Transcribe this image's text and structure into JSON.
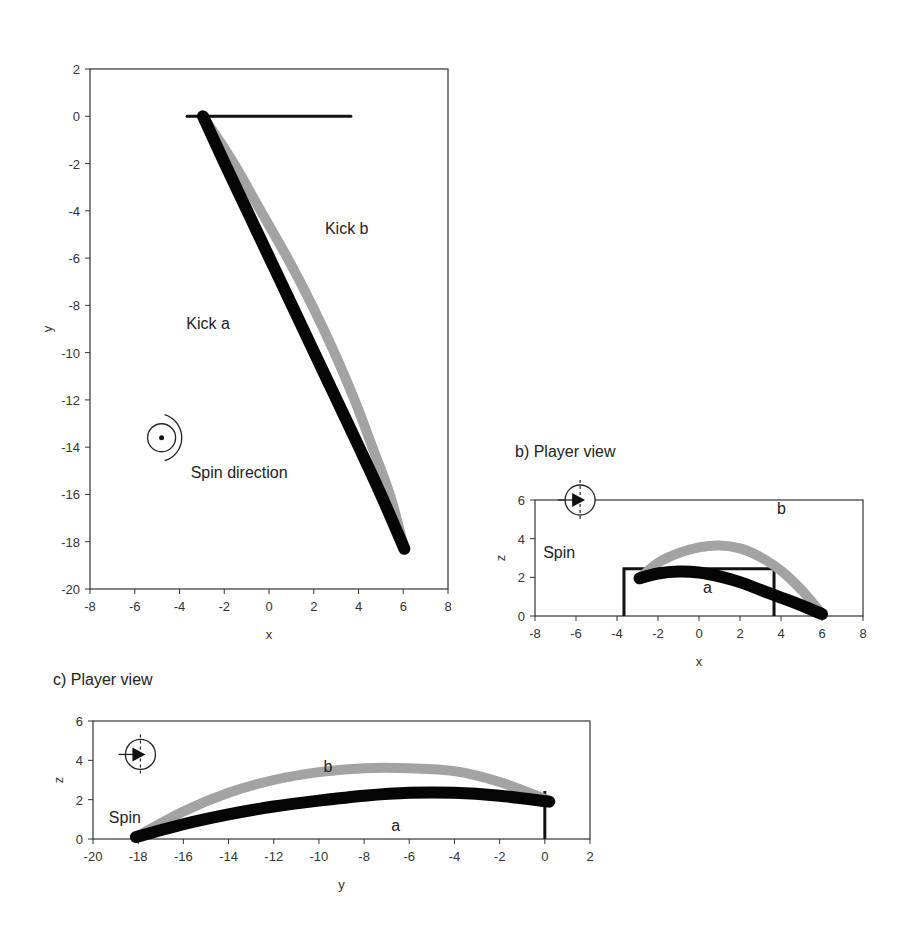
{
  "chart_data": [
    {
      "id": "a",
      "type": "line",
      "title": "",
      "xlabel": "x",
      "ylabel": "y",
      "xlim": [
        -8,
        8
      ],
      "ylim": [
        -20,
        2
      ],
      "xticks": [
        -8,
        -6,
        -4,
        -2,
        0,
        2,
        4,
        6,
        8
      ],
      "yticks": [
        2,
        0,
        -2,
        -4,
        -6,
        -8,
        -10,
        -12,
        -14,
        -16,
        -18,
        -20
      ],
      "grid": false,
      "goal_line": {
        "x": [
          -3.66,
          3.66
        ],
        "y": 0
      },
      "series": [
        {
          "name": "Kick a",
          "color": "#000000",
          "x": [
            -2.95,
            -2.0,
            -1.0,
            0.0,
            1.0,
            2.0,
            3.0,
            4.0,
            5.0,
            6.05
          ],
          "y": [
            0.0,
            -1.95,
            -3.95,
            -5.95,
            -7.95,
            -9.95,
            -11.95,
            -13.95,
            -16.0,
            -18.3
          ]
        },
        {
          "name": "Kick b",
          "color": "#999999",
          "x": [
            -2.95,
            -1.6,
            -0.4,
            0.8,
            1.9,
            2.9,
            3.8,
            4.6,
            5.4,
            6.05
          ],
          "y": [
            0.0,
            -1.95,
            -3.95,
            -5.95,
            -7.95,
            -9.95,
            -11.95,
            -13.95,
            -16.0,
            -18.3
          ]
        }
      ],
      "annotations": [
        {
          "text": "Kick b",
          "x": 2.5,
          "y": -5
        },
        {
          "text": "Kick a",
          "x": -3.7,
          "y": -9
        },
        {
          "text": "Spin direction",
          "x": -3.5,
          "y": -15.3
        }
      ],
      "spin_icon": {
        "x": -4.8,
        "y": -13.6
      }
    },
    {
      "id": "b",
      "type": "line",
      "title": "b) Player view",
      "xlabel": "x",
      "ylabel": "z",
      "xlim": [
        -8,
        8
      ],
      "ylim": [
        0,
        6
      ],
      "xticks": [
        -8,
        -6,
        -4,
        -2,
        0,
        2,
        4,
        6,
        8
      ],
      "yticks": [
        0,
        2,
        4,
        6
      ],
      "grid": false,
      "goal_frame": {
        "x": [
          -3.66,
          3.66
        ],
        "height": 2.44
      },
      "series": [
        {
          "name": "a",
          "color": "#000000",
          "x": [
            -2.9,
            -2.0,
            -1.0,
            0.0,
            1.0,
            2.0,
            3.0,
            4.0,
            5.0,
            6.0
          ],
          "z": [
            1.95,
            2.2,
            2.3,
            2.25,
            2.05,
            1.75,
            1.35,
            0.95,
            0.55,
            0.1
          ]
        },
        {
          "name": "b",
          "color": "#999999",
          "x": [
            -2.9,
            -2.0,
            -1.0,
            0.0,
            1.0,
            2.0,
            3.0,
            4.0,
            5.0,
            6.0
          ],
          "z": [
            1.95,
            2.75,
            3.25,
            3.55,
            3.65,
            3.5,
            3.05,
            2.35,
            1.35,
            0.1
          ]
        }
      ],
      "annotations": [
        {
          "text": "b",
          "x": 3.8,
          "y": 5.3
        },
        {
          "text": "a",
          "x": 0.2,
          "y": 1.2
        },
        {
          "text": "Spin",
          "x": -7.6,
          "y": 3.0
        }
      ],
      "spin_icon": {
        "x": -5.8,
        "y": 6
      }
    },
    {
      "id": "c",
      "type": "line",
      "title": "c) Player view",
      "xlabel": "y",
      "ylabel": "z",
      "xlim": [
        -20,
        2
      ],
      "ylim": [
        0,
        6
      ],
      "xticks": [
        -20,
        -18,
        -16,
        -14,
        -12,
        -10,
        -8,
        -6,
        -4,
        -2,
        0,
        2
      ],
      "yticks": [
        0,
        2,
        4,
        6
      ],
      "grid": false,
      "post": {
        "y": 0,
        "height": 2.44
      },
      "series": [
        {
          "name": "a",
          "color": "#000000",
          "y": [
            -18.1,
            -16.0,
            -14.0,
            -12.0,
            -10.0,
            -8.0,
            -6.0,
            -4.0,
            -2.0,
            0.2
          ],
          "z": [
            0.1,
            0.75,
            1.25,
            1.65,
            1.95,
            2.2,
            2.35,
            2.35,
            2.2,
            1.9
          ]
        },
        {
          "name": "b",
          "color": "#999999",
          "y": [
            -18.1,
            -16.0,
            -14.0,
            -12.0,
            -10.0,
            -8.0,
            -6.0,
            -4.0,
            -2.0,
            0.2
          ],
          "z": [
            0.1,
            1.4,
            2.35,
            3.0,
            3.4,
            3.6,
            3.6,
            3.45,
            2.9,
            1.95
          ]
        }
      ],
      "annotations": [
        {
          "text": "b",
          "x": -9.8,
          "y": 3.4
        },
        {
          "text": "a",
          "x": -6.8,
          "y": 0.4
        },
        {
          "text": "Spin",
          "x": -19.3,
          "y": 0.8
        }
      ],
      "spin_icon": {
        "x": -17.9,
        "y": 4.3
      }
    }
  ],
  "labels": {
    "kick_b": "Kick b",
    "kick_a": "Kick a",
    "spin_direction": "Spin direction",
    "panel_b_title": "b) Player view",
    "panel_c_title": "c) Player view",
    "spin": "Spin",
    "a": "a",
    "b": "b",
    "x": "x",
    "y": "y",
    "z": "z"
  }
}
